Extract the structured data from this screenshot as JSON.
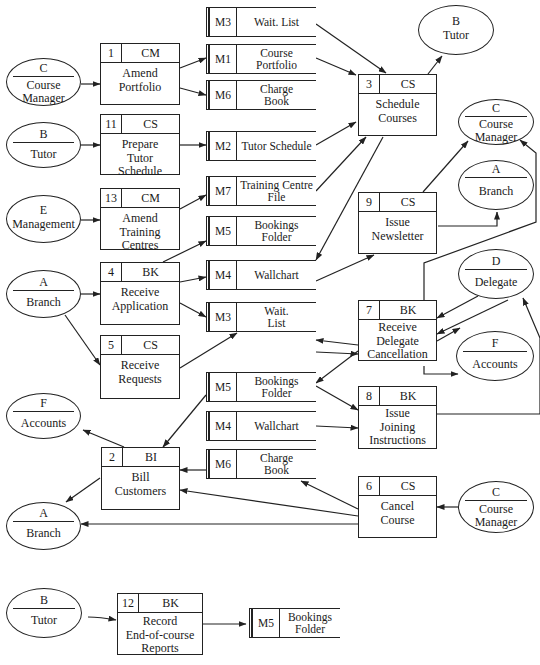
{
  "diagram": {
    "type": "data-flow-diagram",
    "processes": [
      {
        "id": "1",
        "owner": "CM",
        "name": "Amend\nPortfolio"
      },
      {
        "id": "11",
        "owner": "CS",
        "name": "Prepare\nTutor\nSchedule"
      },
      {
        "id": "13",
        "owner": "CM",
        "name": "Amend\nTraining\nCentres"
      },
      {
        "id": "4",
        "owner": "BK",
        "name": "Receive\nApplication"
      },
      {
        "id": "5",
        "owner": "CS",
        "name": "Receive\nRequests"
      },
      {
        "id": "2",
        "owner": "BI",
        "name": "Bill\nCustomers"
      },
      {
        "id": "3",
        "owner": "CS",
        "name": "Schedule\nCourses"
      },
      {
        "id": "9",
        "owner": "CS",
        "name": "Issue\nNewsletter"
      },
      {
        "id": "7",
        "owner": "BK",
        "name": "Receive\nDelegate\nCancellation"
      },
      {
        "id": "8",
        "owner": "BK",
        "name": "Issue\nJoining\nInstructions"
      },
      {
        "id": "6",
        "owner": "CS",
        "name": "Cancel\nCourse"
      },
      {
        "id": "12",
        "owner": "BK",
        "name": "Record\nEnd-of-course\nReports"
      }
    ],
    "stores": [
      {
        "id": "M3",
        "name": "Wait. List"
      },
      {
        "id": "M1",
        "name": "Course\nPortfolio"
      },
      {
        "id": "M6",
        "name": "Charge\nBook"
      },
      {
        "id": "M2",
        "name": "Tutor Schedule"
      },
      {
        "id": "M7",
        "name": "Training Centre\nFile"
      },
      {
        "id": "M5",
        "name": "Bookings\nFolder"
      },
      {
        "id": "M4",
        "name": "Wallchart"
      },
      {
        "id": "M3",
        "name": "Wait.\nList"
      },
      {
        "id": "M5",
        "name": "Bookings\nFolder"
      },
      {
        "id": "M4",
        "name": "Wallchart"
      },
      {
        "id": "M6",
        "name": "Charge\nBook"
      },
      {
        "id": "M5",
        "name": "Bookings\nFolder"
      }
    ],
    "externals": [
      {
        "id": "C",
        "name": "Course\nManager"
      },
      {
        "id": "B",
        "name": "Tutor"
      },
      {
        "id": "E",
        "name": "Management"
      },
      {
        "id": "A",
        "name": "Branch"
      },
      {
        "id": "F",
        "name": "Accounts"
      },
      {
        "id": "A",
        "name": "Branch"
      },
      {
        "id": "B",
        "name": "Tutor"
      },
      {
        "id": "C",
        "name": "Course\nManager"
      },
      {
        "id": "A",
        "name": "Branch"
      },
      {
        "id": "D",
        "name": "Delegate"
      },
      {
        "id": "F",
        "name": "Accounts"
      },
      {
        "id": "C",
        "name": "Course\nManager"
      },
      {
        "id": "B",
        "name": "Tutor"
      }
    ]
  }
}
